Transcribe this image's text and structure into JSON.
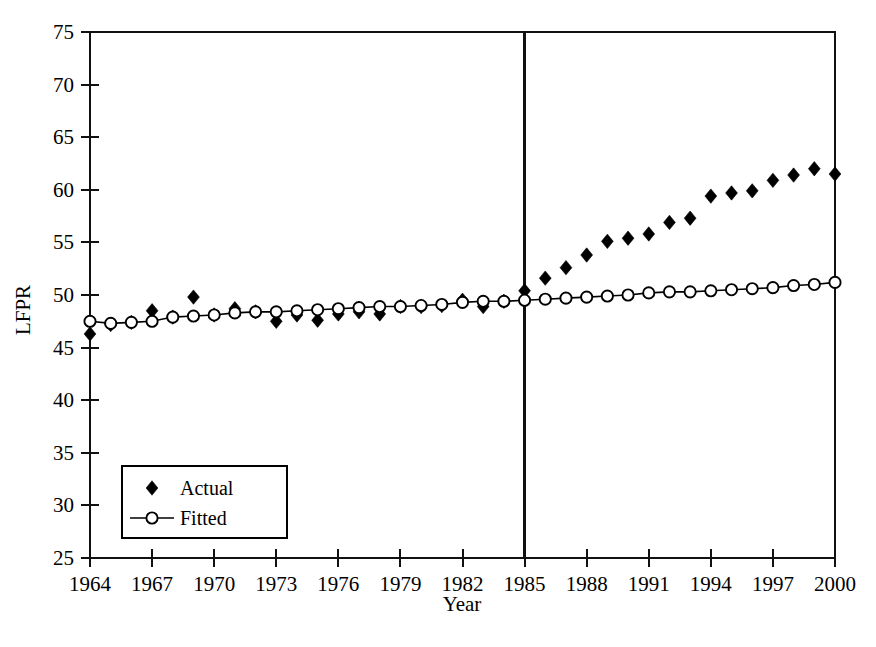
{
  "chart_data": {
    "type": "scatter",
    "title": "",
    "xlabel": "Year",
    "ylabel": "LFPR",
    "xlim": [
      1964,
      2000
    ],
    "ylim": [
      25,
      75
    ],
    "ytick_step": 5,
    "xtick_step": 3,
    "grid": false,
    "legend_position": "lower-left",
    "xticks": [
      "1964",
      "1967",
      "1970",
      "1973",
      "1976",
      "1979",
      "1982",
      "1985",
      "1988",
      "1991",
      "1994",
      "1997",
      "2000"
    ],
    "yticks": [
      "25",
      "30",
      "35",
      "40",
      "45",
      "50",
      "55",
      "60",
      "65",
      "70",
      "75"
    ],
    "annotations": [
      {
        "name": "structural-break-line",
        "type": "vline",
        "x": 1985
      }
    ],
    "x": [
      1964,
      1965,
      1966,
      1967,
      1968,
      1969,
      1970,
      1971,
      1972,
      1973,
      1974,
      1975,
      1976,
      1977,
      1978,
      1979,
      1980,
      1981,
      1982,
      1983,
      1984,
      1985,
      1986,
      1987,
      1988,
      1989,
      1990,
      1991,
      1992,
      1993,
      1994,
      1995,
      1996,
      1997,
      1998,
      1999,
      2000
    ],
    "series": [
      {
        "name": "Actual",
        "marker": "filled-diamond",
        "line": false,
        "color": "#000000",
        "values": [
          46.3,
          47.2,
          47.4,
          48.5,
          47.9,
          49.8,
          48.1,
          48.7,
          48.4,
          47.5,
          48.1,
          47.6,
          48.2,
          48.4,
          48.2,
          48.9,
          48.9,
          49.0,
          49.5,
          48.9,
          49.4,
          50.4,
          51.6,
          52.6,
          53.8,
          55.1,
          55.4,
          55.8,
          56.9,
          57.3,
          59.4,
          59.7,
          59.9,
          60.9,
          61.4,
          62.0,
          61.5
        ]
      },
      {
        "name": "Fitted",
        "marker": "open-circle",
        "line": true,
        "color": "#000000",
        "values": [
          47.5,
          47.3,
          47.4,
          47.5,
          47.9,
          48.0,
          48.1,
          48.3,
          48.4,
          48.4,
          48.5,
          48.6,
          48.7,
          48.8,
          48.9,
          48.9,
          49.0,
          49.1,
          49.3,
          49.4,
          49.4,
          49.5,
          49.6,
          49.7,
          49.8,
          49.9,
          50.0,
          50.2,
          50.3,
          50.3,
          50.4,
          50.5,
          50.6,
          50.7,
          50.9,
          51.0,
          51.2
        ]
      }
    ],
    "legend": [
      {
        "label": "Actual",
        "marker": "filled-diamond",
        "line": false
      },
      {
        "label": "Fitted",
        "marker": "open-circle",
        "line": true
      }
    ]
  },
  "layout": {
    "plot": {
      "left": 90,
      "right": 835,
      "top": 32,
      "bottom": 558
    },
    "legend": {
      "x": 122,
      "y": 466,
      "w": 165,
      "h": 72
    }
  }
}
